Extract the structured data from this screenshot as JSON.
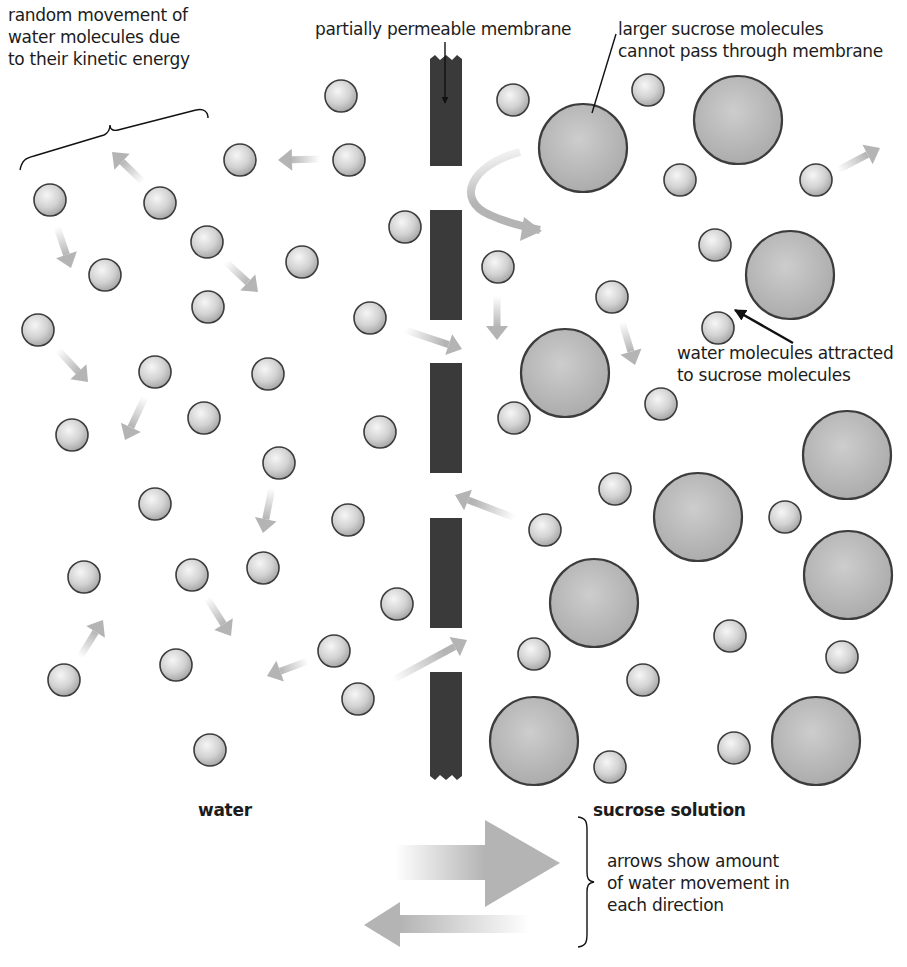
{
  "diagram": {
    "colors": {
      "background": "#ffffff",
      "membrane": "#3a3a3a",
      "water_molecule_fill": "#d6d6d6",
      "water_molecule_highlight": "#f4f4f4",
      "sucrose_molecule_fill": "#b9b9b9",
      "molecule_outline": "#3c3c3c",
      "movement_arrow": "#b4b4b4",
      "pointer_line": "#111111",
      "text": "#1c1c1c"
    },
    "labels": {
      "random_movement": [
        "random movement of",
        "water molecules due",
        "to their kinetic energy"
      ],
      "membrane": "partially permeable membrane",
      "sucrose_cannot_pass": [
        "larger sucrose molecules",
        "cannot pass through membrane"
      ],
      "water_attracted": [
        "water molecules attracted",
        "to sucrose molecules"
      ],
      "left_side": "water",
      "right_side": "sucrose solution",
      "arrows_legend": [
        "arrows show amount",
        "of water movement in",
        "each direction"
      ]
    },
    "membrane_segments": [
      {
        "x": 430,
        "y": 55,
        "w": 32,
        "h": 111,
        "jagged": "top"
      },
      {
        "x": 430,
        "y": 210,
        "w": 32,
        "h": 110
      },
      {
        "x": 430,
        "y": 363,
        "w": 32,
        "h": 110
      },
      {
        "x": 430,
        "y": 518,
        "w": 32,
        "h": 110
      },
      {
        "x": 430,
        "y": 672,
        "w": 32,
        "h": 108,
        "jagged": "bottom"
      }
    ],
    "water_molecules": [
      {
        "cx": 341,
        "cy": 96
      },
      {
        "cx": 240,
        "cy": 160
      },
      {
        "cx": 349,
        "cy": 160
      },
      {
        "cx": 50,
        "cy": 200
      },
      {
        "cx": 160,
        "cy": 203
      },
      {
        "cx": 207,
        "cy": 242
      },
      {
        "cx": 105,
        "cy": 275
      },
      {
        "cx": 302,
        "cy": 262
      },
      {
        "cx": 208,
        "cy": 307
      },
      {
        "cx": 38,
        "cy": 330
      },
      {
        "cx": 155,
        "cy": 372
      },
      {
        "cx": 268,
        "cy": 374
      },
      {
        "cx": 370,
        "cy": 318
      },
      {
        "cx": 204,
        "cy": 418
      },
      {
        "cx": 72,
        "cy": 435
      },
      {
        "cx": 380,
        "cy": 432
      },
      {
        "cx": 405,
        "cy": 227
      },
      {
        "cx": 279,
        "cy": 463
      },
      {
        "cx": 155,
        "cy": 504
      },
      {
        "cx": 348,
        "cy": 520
      },
      {
        "cx": 84,
        "cy": 577
      },
      {
        "cx": 192,
        "cy": 575
      },
      {
        "cx": 263,
        "cy": 568
      },
      {
        "cx": 397,
        "cy": 604
      },
      {
        "cx": 334,
        "cy": 651
      },
      {
        "cx": 176,
        "cy": 665
      },
      {
        "cx": 64,
        "cy": 680
      },
      {
        "cx": 358,
        "cy": 699
      },
      {
        "cx": 210,
        "cy": 750
      },
      {
        "cx": 513,
        "cy": 100
      },
      {
        "cx": 648,
        "cy": 90
      },
      {
        "cx": 680,
        "cy": 180
      },
      {
        "cx": 816,
        "cy": 180
      },
      {
        "cx": 715,
        "cy": 245
      },
      {
        "cx": 498,
        "cy": 267
      },
      {
        "cx": 612,
        "cy": 297
      },
      {
        "cx": 718,
        "cy": 328
      },
      {
        "cx": 514,
        "cy": 418
      },
      {
        "cx": 661,
        "cy": 404
      },
      {
        "cx": 615,
        "cy": 489
      },
      {
        "cx": 785,
        "cy": 517
      },
      {
        "cx": 545,
        "cy": 530
      },
      {
        "cx": 730,
        "cy": 636
      },
      {
        "cx": 534,
        "cy": 654
      },
      {
        "cx": 842,
        "cy": 657
      },
      {
        "cx": 643,
        "cy": 680
      },
      {
        "cx": 610,
        "cy": 767
      },
      {
        "cx": 734,
        "cy": 748
      }
    ],
    "water_molecule_radius": 16,
    "sucrose_molecules": [
      {
        "cx": 583,
        "cy": 148
      },
      {
        "cx": 738,
        "cy": 120
      },
      {
        "cx": 790,
        "cy": 275
      },
      {
        "cx": 565,
        "cy": 373
      },
      {
        "cx": 847,
        "cy": 455
      },
      {
        "cx": 698,
        "cy": 517
      },
      {
        "cx": 848,
        "cy": 575
      },
      {
        "cx": 594,
        "cy": 603
      },
      {
        "cx": 534,
        "cy": 741
      },
      {
        "cx": 816,
        "cy": 741
      }
    ],
    "sucrose_molecule_radius": 44,
    "movement_arrows": [
      {
        "from": [
          320,
          159
        ],
        "to": [
          278,
          160
        ]
      },
      {
        "from": [
          143,
          182
        ],
        "to": [
          112,
          152
        ]
      },
      {
        "from": [
          57,
          227
        ],
        "to": [
          71,
          268
        ]
      },
      {
        "from": [
          226,
          262
        ],
        "to": [
          258,
          292
        ]
      },
      {
        "from": [
          58,
          350
        ],
        "to": [
          88,
          382
        ]
      },
      {
        "from": [
          145,
          397
        ],
        "to": [
          125,
          440
        ]
      },
      {
        "from": [
          405,
          330
        ],
        "to": [
          462,
          349
        ]
      },
      {
        "from": [
          497,
          296
        ],
        "to": [
          497,
          340
        ]
      },
      {
        "from": [
          622,
          322
        ],
        "to": [
          635,
          365
        ]
      },
      {
        "from": [
          515,
          518
        ],
        "to": [
          455,
          495
        ]
      },
      {
        "from": [
          272,
          488
        ],
        "to": [
          263,
          533
        ]
      },
      {
        "from": [
          80,
          657
        ],
        "to": [
          103,
          620
        ]
      },
      {
        "from": [
          207,
          598
        ],
        "to": [
          231,
          636
        ]
      },
      {
        "from": [
          308,
          661
        ],
        "to": [
          267,
          676
        ]
      },
      {
        "from": [
          393,
          680
        ],
        "to": [
          467,
          640
        ]
      },
      {
        "from": [
          838,
          170
        ],
        "to": [
          880,
          148
        ]
      }
    ],
    "curved_arrow": {
      "path": "M 520 152 C 470 165, 455 200, 490 215 C 505 222, 520 226, 540 230",
      "head_at": [
        540,
        231
      ]
    },
    "legend_arrows": {
      "into_solution": {
        "shaft": [
          395,
          845,
          90,
          35
        ],
        "head": [
          [
            485,
            820
          ],
          [
            560,
            863
          ],
          [
            485,
            907
          ]
        ]
      },
      "into_water": {
        "shaft": [
          400,
          915,
          130,
          18
        ],
        "head": [
          [
            400,
            902
          ],
          [
            364,
            925
          ],
          [
            400,
            947
          ]
        ]
      }
    }
  }
}
